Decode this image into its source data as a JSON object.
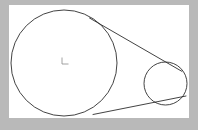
{
  "figure": {
    "title": "Two circles with common external tangent lines",
    "background_color": "#b9b9b9",
    "canvas_color": "#ffffff",
    "stroke_color": "#2e2e2e",
    "center_mark_color": "#8a8a8a",
    "canvas": {
      "left": 9,
      "top": 5,
      "width": 180,
      "height": 113
    },
    "large_circle": {
      "label": "large-circle",
      "center_x": 64,
      "center_y": 63,
      "radius": 53
    },
    "small_circle": {
      "label": "small-circle",
      "center_x": 165.5,
      "center_y": 83.5,
      "radius": 21.5
    },
    "center_mark": {
      "label": "center-mark",
      "x": 62,
      "y": 58,
      "width": 6,
      "height": 7,
      "path": "M 62 58 L 62 64 L 68 64"
    },
    "tangents": [
      {
        "label": "upper-tangent",
        "x1": 89.5,
        "y1": 18.0,
        "x2": 182.0,
        "y2": 71.4
      },
      {
        "label": "lower-tangent",
        "x1": 93.0,
        "y1": 114.5,
        "x2": 186.0,
        "y2": 96.0
      }
    ]
  }
}
